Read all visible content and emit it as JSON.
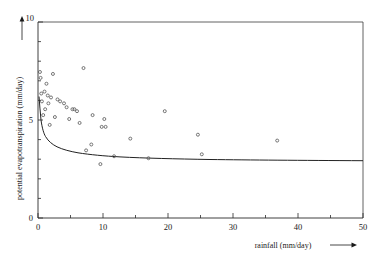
{
  "chart_data": {
    "type": "scatter",
    "title": "",
    "xlabel": "rainfall (mm/day)",
    "ylabel": "potential evapotranspiration (mm/day)",
    "xlim": [
      0,
      50
    ],
    "ylim": [
      0,
      10
    ],
    "xticks": [
      0,
      10,
      20,
      30,
      40,
      50
    ],
    "xtick_labels": [
      "0",
      "10",
      "20",
      "30",
      "40",
      "50"
    ],
    "xminor_step": 5,
    "yticks": [
      0,
      5,
      10
    ],
    "ytick_labels": [
      "0",
      "5",
      "10"
    ],
    "yminor_step": 1,
    "grid": false,
    "legend": "none",
    "points": [
      [
        0.3,
        7.45
      ],
      [
        0.4,
        7.15
      ],
      [
        0.5,
        6.35
      ],
      [
        0.6,
        5.95
      ],
      [
        0.8,
        5.25
      ],
      [
        1.0,
        6.45
      ],
      [
        1.1,
        5.55
      ],
      [
        1.3,
        6.85
      ],
      [
        1.5,
        6.25
      ],
      [
        1.6,
        5.85
      ],
      [
        1.8,
        4.75
      ],
      [
        2.0,
        6.15
      ],
      [
        2.3,
        7.35
      ],
      [
        2.6,
        5.15
      ],
      [
        3.0,
        6.05
      ],
      [
        3.4,
        5.95
      ],
      [
        4.0,
        5.85
      ],
      [
        4.4,
        5.65
      ],
      [
        4.8,
        5.05
      ],
      [
        5.3,
        5.55
      ],
      [
        5.6,
        5.55
      ],
      [
        6.0,
        5.45
      ],
      [
        6.4,
        4.85
      ],
      [
        7.0,
        7.65
      ],
      [
        7.4,
        3.45
      ],
      [
        8.2,
        3.75
      ],
      [
        8.4,
        5.25
      ],
      [
        9.6,
        2.75
      ],
      [
        9.8,
        4.65
      ],
      [
        10.2,
        5.05
      ],
      [
        10.4,
        4.65
      ],
      [
        11.7,
        3.15
      ],
      [
        14.2,
        4.05
      ],
      [
        17.0,
        3.05
      ],
      [
        19.5,
        5.45
      ],
      [
        24.6,
        4.25
      ],
      [
        25.2,
        3.25
      ],
      [
        36.8,
        3.95
      ]
    ],
    "curve": {
      "description": "decaying fitted curve approaching asymptote",
      "asymptote": 4.35,
      "y_at_zero": 6.2
    }
  }
}
